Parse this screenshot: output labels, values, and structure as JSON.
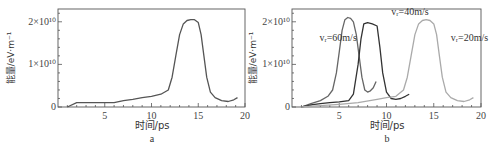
{
  "chart_data": [
    {
      "panel": "a",
      "type": "line",
      "title": "",
      "xlabel": "时间/ps",
      "ylabel": "能量/eV·m⁻¹",
      "xlim": [
        0,
        20
      ],
      "ylim": [
        0,
        23000000000.0
      ],
      "xticks": [
        5,
        10,
        15,
        20
      ],
      "yticks": [
        {
          "value": 0,
          "label": "0"
        },
        {
          "value": 10000000000.0,
          "label": "1×10¹⁰"
        },
        {
          "value": 20000000000.0,
          "label": "2×10¹⁰"
        }
      ],
      "grid": false,
      "series": [
        {
          "name": "",
          "color": "#555555",
          "x": [
            1.0,
            2.0,
            3.0,
            4.0,
            5.0,
            6.0,
            7.0,
            8.0,
            9.0,
            10.0,
            11.0,
            11.8,
            12.2,
            12.6,
            13.0,
            13.4,
            13.8,
            14.2,
            14.6,
            15.0,
            15.3,
            15.6,
            15.9,
            16.3,
            16.8,
            17.5,
            18.2,
            18.8,
            19.2
          ],
          "y": [
            0.0,
            1000000000.0,
            1000000000.0,
            1000000000.0,
            1000000000.0,
            1000000000.0,
            1500000000.0,
            1800000000.0,
            2200000000.0,
            2500000000.0,
            3000000000.0,
            4000000000.0,
            7000000000.0,
            12000000000.0,
            17000000000.0,
            19500000000.0,
            20300000000.0,
            20500000000.0,
            20500000000.0,
            19800000000.0,
            17000000000.0,
            12000000000.0,
            7000000000.0,
            3500000000.0,
            2200000000.0,
            1500000000.0,
            1300000000.0,
            1700000000.0,
            2200000000.0
          ]
        }
      ],
      "panel_label": "a"
    },
    {
      "panel": "b",
      "type": "line",
      "title": "",
      "xlabel": "时间/ps",
      "ylabel": "能量/eV·m⁻¹",
      "xlim": [
        0,
        20
      ],
      "ylim": [
        0,
        23000000000.0
      ],
      "xticks": [
        5,
        10,
        15,
        20
      ],
      "yticks": [
        {
          "value": 0,
          "label": "0"
        },
        {
          "value": 10000000000.0,
          "label": "1×10¹⁰"
        },
        {
          "value": 20000000000.0,
          "label": "2×10¹⁰"
        }
      ],
      "grid": false,
      "series": [
        {
          "name": "vr=60m/s",
          "color": "#666666",
          "x": [
            1.0,
            2.0,
            3.0,
            3.8,
            4.3,
            4.7,
            5.0,
            5.3,
            5.6,
            5.9,
            6.2,
            6.5,
            6.8,
            7.1,
            7.4,
            7.7,
            8.0,
            8.3,
            8.6,
            8.9
          ],
          "y": [
            0.0,
            800000000.0,
            1500000000.0,
            2500000000.0,
            4000000000.0,
            8000000000.0,
            13000000000.0,
            18000000000.0,
            20500000000.0,
            21000000000.0,
            20800000000.0,
            20000000000.0,
            17000000000.0,
            12000000000.0,
            7000000000.0,
            4000000000.0,
            3500000000.0,
            3800000000.0,
            4500000000.0,
            6000000000.0
          ]
        },
        {
          "name": "vr=40m/s",
          "color": "#333333",
          "x": [
            1.0,
            2.0,
            3.0,
            4.0,
            5.0,
            6.0,
            6.5,
            7.0,
            7.3,
            7.6,
            8.0,
            8.5,
            9.0,
            9.3,
            9.6,
            10.0,
            10.5,
            11.0,
            11.5,
            12.0,
            12.4
          ],
          "y": [
            0.0,
            500000000.0,
            800000000.0,
            1000000000.0,
            1200000000.0,
            1500000000.0,
            3000000000.0,
            10000000000.0,
            16000000000.0,
            19500000000.0,
            19800000000.0,
            19500000000.0,
            19000000000.0,
            14000000000.0,
            8000000000.0,
            3500000000.0,
            2000000000.0,
            1800000000.0,
            2000000000.0,
            2500000000.0,
            3000000000.0
          ]
        },
        {
          "name": "vr=20m/s",
          "color": "#aaaaaa",
          "x": [
            1.0,
            3.0,
            5.0,
            7.0,
            9.0,
            10.0,
            11.0,
            11.8,
            12.2,
            12.6,
            13.0,
            13.4,
            13.8,
            14.2,
            14.6,
            15.0,
            15.3,
            15.6,
            15.9,
            16.3,
            16.8,
            17.5,
            18.2,
            18.8,
            19.2
          ],
          "y": [
            0.0,
            300000000.0,
            600000000.0,
            1000000000.0,
            1800000000.0,
            2200000000.0,
            2500000000.0,
            4000000000.0,
            7000000000.0,
            12000000000.0,
            17000000000.0,
            19500000000.0,
            20300000000.0,
            20500000000.0,
            20300000000.0,
            19500000000.0,
            17000000000.0,
            12000000000.0,
            7000000000.0,
            3500000000.0,
            2200000000.0,
            1500000000.0,
            1300000000.0,
            1700000000.0,
            2200000000.0
          ]
        }
      ],
      "annotations": [
        {
          "text": "vᵣ=60m/s",
          "x": 2.9,
          "y": 15500000000.0
        },
        {
          "text": "vᵣ=40m/s",
          "x": 10.5,
          "y": 21500000000.0
        },
        {
          "text": "vᵣ=20m/s",
          "x": 16.8,
          "y": 15500000000.0
        }
      ],
      "panel_label": "b"
    }
  ]
}
